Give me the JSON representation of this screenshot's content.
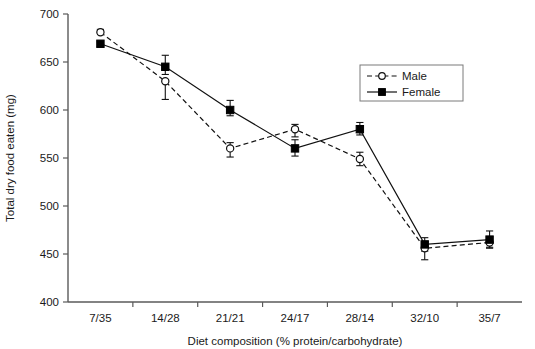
{
  "chart_data": {
    "type": "line",
    "title": "",
    "xlabel": "Diet composition (% protein/carbohydrate)",
    "ylabel": "Total dry food eaten (mg)",
    "categories": [
      "7/35",
      "14/28",
      "21/21",
      "24/17",
      "28/14",
      "32/10",
      "35/7"
    ],
    "ylim": [
      400,
      700
    ],
    "yticks": [
      400,
      450,
      500,
      550,
      600,
      650,
      700
    ],
    "ytick_labels": [
      "400",
      "450",
      "500",
      "550",
      "600",
      "650",
      "700"
    ],
    "grid": false,
    "legend_position": "top-right",
    "series": [
      {
        "name": "Male",
        "marker": "open-circle",
        "line_style": "dashed",
        "color": "#111111",
        "values": [
          681,
          630,
          560,
          580,
          549,
          456,
          462
        ],
        "err_low": [
          681,
          611,
          551,
          572,
          542,
          444,
          456
        ],
        "err_high": [
          684,
          630,
          566,
          585,
          556,
          463,
          468
        ]
      },
      {
        "name": "Female",
        "marker": "filled-square",
        "line_style": "solid",
        "color": "#111111",
        "values": [
          669,
          645,
          600,
          560,
          580,
          460,
          465
        ],
        "err_low": [
          666,
          637,
          594,
          552,
          574,
          453,
          457
        ],
        "err_high": [
          671,
          657,
          610,
          569,
          587,
          467,
          474
        ]
      }
    ]
  },
  "legend": {
    "entries": [
      {
        "label": "Male"
      },
      {
        "label": "Female"
      }
    ]
  }
}
